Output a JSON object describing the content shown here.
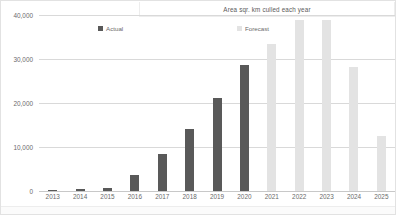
{
  "chart_data": {
    "type": "bar",
    "title": "Area sqr. km culled each year",
    "xlabel": "",
    "ylabel": "",
    "ylim": [
      0,
      40000
    ],
    "grid": true,
    "legend_position": "top",
    "categories": [
      "2013",
      "2014",
      "2015",
      "2016",
      "2017",
      "2018",
      "2019",
      "2020",
      "2021",
      "2022",
      "2023",
      "2024",
      "2025"
    ],
    "ytick_labels": [
      "40,000",
      "30,000",
      "20,000",
      "10,000",
      "0"
    ],
    "ytick_values": [
      40000,
      30000,
      20000,
      10000,
      0
    ],
    "series": [
      {
        "name": "Actual",
        "color": "#595959",
        "values": [
          300,
          350,
          600,
          3600,
          8500,
          14200,
          21200,
          28700,
          null,
          null,
          null,
          null,
          null
        ]
      },
      {
        "name": "Forecast",
        "color": "#e3e3e3",
        "values": [
          null,
          null,
          null,
          null,
          null,
          null,
          null,
          null,
          33500,
          38800,
          38800,
          28200,
          12500
        ]
      }
    ]
  },
  "legend": {
    "items": [
      {
        "label": "Actual",
        "color": "#595959"
      },
      {
        "label": "Forecast",
        "color": "#e3e3e3"
      }
    ]
  },
  "colors": {
    "actual": "#595959",
    "forecast": "#e3e3e3",
    "gridline": "#d9d9d9",
    "axis_text": "#6a6a6a",
    "border": "#e2e2e2"
  }
}
